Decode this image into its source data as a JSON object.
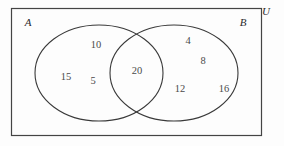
{
  "diagram": {
    "type": "venn-two-set",
    "title_visible": false,
    "universe_label": "U",
    "set_labels": {
      "left": "A",
      "right": "B"
    },
    "colors": {
      "background": "#fdfdfd",
      "stroke": "#3a3a3a",
      "universe_stroke": "#444444",
      "label_text": "#2b2b2b",
      "value_text": "#4a4a4a"
    },
    "regions": [
      {
        "id": "left-only",
        "name": "A-only",
        "values": [
          "10",
          "15",
          "5"
        ]
      },
      {
        "id": "intersection",
        "name": "A-intersect-B",
        "values": [
          "20"
        ]
      },
      {
        "id": "right-only",
        "name": "B-only",
        "values": [
          "4",
          "8",
          "12",
          "16"
        ]
      }
    ],
    "elements": {
      "a_only_top": "10",
      "a_only_left": "15",
      "a_only_mid": "5",
      "intersection": "20",
      "b_only_top": "4",
      "b_only_mid": "8",
      "b_only_lower_left": "12",
      "b_only_right": "16"
    }
  }
}
